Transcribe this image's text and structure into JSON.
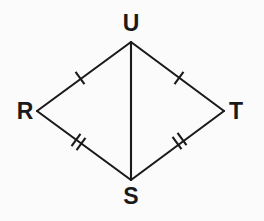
{
  "figure": {
    "kind": "geometry-diagram",
    "shape_name": "kite RUTS with diagonal US",
    "background_color": "#fbfbfb",
    "stroke_color": "#1a1a1a",
    "stroke_width": 2.1,
    "width": 264,
    "height": 221,
    "vertices": [
      {
        "id": "U",
        "label": "U",
        "x": 131,
        "y": 42,
        "label_x": 131,
        "label_y": 31,
        "label_anchor": "middle"
      },
      {
        "id": "R",
        "label": "R",
        "x": 37,
        "y": 111,
        "label_x": 25,
        "label_y": 119,
        "label_anchor": "middle"
      },
      {
        "id": "T",
        "label": "T",
        "x": 224,
        "y": 111,
        "label_x": 236,
        "label_y": 119,
        "label_anchor": "middle"
      },
      {
        "id": "S",
        "label": "S",
        "x": 131,
        "y": 180,
        "label_x": 131,
        "label_y": 204,
        "label_anchor": "middle"
      }
    ],
    "segments": [
      {
        "id": "RU",
        "from": "R",
        "to": "U",
        "x1": 37,
        "y1": 111,
        "x2": 131,
        "y2": 42,
        "tick_count": 1
      },
      {
        "id": "UT",
        "from": "U",
        "to": "T",
        "x1": 131,
        "y1": 42,
        "x2": 224,
        "y2": 111,
        "tick_count": 1
      },
      {
        "id": "RS",
        "from": "R",
        "to": "S",
        "x1": 37,
        "y1": 111,
        "x2": 131,
        "y2": 180,
        "tick_count": 2
      },
      {
        "id": "ST",
        "from": "S",
        "to": "T",
        "x1": 131,
        "y1": 180,
        "x2": 224,
        "y2": 111,
        "tick_count": 2
      },
      {
        "id": "US",
        "from": "U",
        "to": "S",
        "x1": 131,
        "y1": 42,
        "x2": 131,
        "y2": 180,
        "tick_count": 0
      }
    ],
    "tick_marks": [
      {
        "id": "tick-RU-1",
        "segment": "RU",
        "cx": 80,
        "cy": 78,
        "angle_deg": -36.3,
        "length": 15
      },
      {
        "id": "tick-UT-1",
        "segment": "UT",
        "cx": 179,
        "cy": 78,
        "angle_deg": 36.6,
        "length": 15
      },
      {
        "id": "tick-RS-1",
        "segment": "RS",
        "cx": 76,
        "cy": 140,
        "angle_deg": 36.3,
        "length": 15
      },
      {
        "id": "tick-RS-2",
        "segment": "RS",
        "cx": 81,
        "cy": 144,
        "angle_deg": 36.3,
        "length": 15
      },
      {
        "id": "tick-ST-1",
        "segment": "ST",
        "cx": 177,
        "cy": 143,
        "angle_deg": -36.6,
        "length": 15
      },
      {
        "id": "tick-ST-2",
        "segment": "ST",
        "cx": 182,
        "cy": 139,
        "angle_deg": -36.6,
        "length": 15
      }
    ],
    "label_font_size": 23
  }
}
